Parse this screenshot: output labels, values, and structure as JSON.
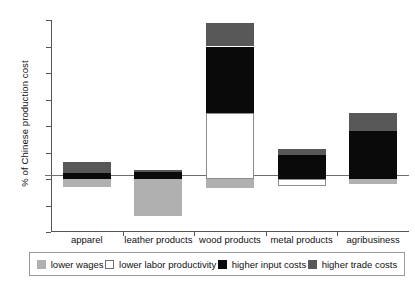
{
  "chart_data": {
    "type": "bar",
    "stacked": true,
    "title": "",
    "subtitle": "",
    "xlabel": "",
    "ylabel": "% of Chinese production cost",
    "ylim": [
      -40,
      120
    ],
    "yticks": [
      -40,
      -20,
      0,
      20,
      40,
      60,
      80,
      100,
      120
    ],
    "ytick_labels": [
      "-40",
      "-20",
      "0",
      "20",
      "40",
      "60",
      "80",
      "100",
      "120"
    ],
    "grid": false,
    "legend_position": "bottom",
    "categories": [
      "apparel",
      "leather products",
      "wood products",
      "metal products",
      "agribusiness"
    ],
    "series": [
      {
        "name": "lower wages",
        "color": "#b0b0b0",
        "values": [
          -6,
          -28,
          -7,
          0,
          -4
        ]
      },
      {
        "name": "lower labor productivity",
        "color": "#ffffff",
        "values": [
          0,
          0,
          50,
          -5,
          0
        ]
      },
      {
        "name": "higher input costs",
        "color": "#0a0a0a",
        "values": [
          4.5,
          5,
          50,
          18,
          36
        ]
      },
      {
        "name": "higher trade costs",
        "color": "#585858",
        "values": [
          8.5,
          2,
          18,
          5,
          14
        ]
      }
    ],
    "totals_positive": [
      13,
      7,
      118,
      23,
      50
    ],
    "totals_negative": [
      -6,
      -28,
      -7,
      -5,
      -4
    ]
  },
  "legend": {
    "items": [
      {
        "label": "lower wages",
        "icon": "legend-swatch-lower-wages"
      },
      {
        "label": "lower labor productivity",
        "icon": "legend-swatch-lower-labor-productivity"
      },
      {
        "label": "higher input costs",
        "icon": "legend-swatch-higher-input-costs"
      },
      {
        "label": "higher trade costs",
        "icon": "legend-swatch-higher-trade-costs"
      }
    ]
  },
  "colors": {
    "lower_wages": "#b0b0b0",
    "lower_labor_productivity": "#ffffff",
    "higher_input_costs": "#0a0a0a",
    "higher_trade_costs": "#585858",
    "axis": "#555555",
    "background": "#ffffff"
  }
}
